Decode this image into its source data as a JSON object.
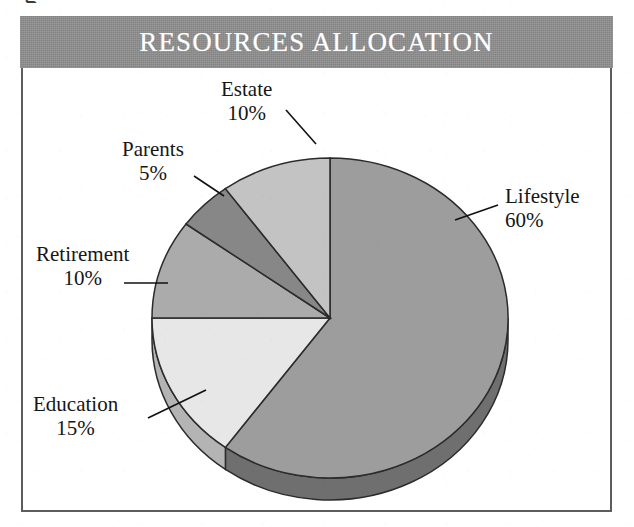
{
  "document": {
    "cut_glyph": "g"
  },
  "header": {
    "title": "RESOURCES ALLOCATION",
    "band_color": "#8e8e8e",
    "title_color": "#ffffff"
  },
  "frame": {
    "border_color": "#5d5d5d",
    "background": "#ffffff"
  },
  "chart_data": {
    "type": "pie",
    "title": "RESOURCES ALLOCATION",
    "xlabel": "",
    "ylabel": "",
    "legend_position": "none",
    "grid": false,
    "labels_show_percent": true,
    "three_d": true,
    "start_angle_deg": 0,
    "direction": "clockwise",
    "categories": [
      "Lifestyle",
      "Education",
      "Retirement",
      "Parents",
      "Estate"
    ],
    "values": [
      60,
      15,
      10,
      5,
      10
    ],
    "units": "%",
    "slices": [
      {
        "label": "Lifestyle",
        "value": 60,
        "percent_text": "60%",
        "color": "#9d9d9d",
        "side_color": "#6f6f6f"
      },
      {
        "label": "Education",
        "value": 15,
        "percent_text": "15%",
        "color": "#e7e7e7",
        "side_color": "#b4b4b4"
      },
      {
        "label": "Retirement",
        "value": 10,
        "percent_text": "10%",
        "color": "#ababab",
        "side_color": "#7c7c7c"
      },
      {
        "label": "Parents",
        "value": 5,
        "percent_text": "5%",
        "color": "#878787",
        "side_color": "#626262"
      },
      {
        "label": "Estate",
        "value": 10,
        "percent_text": "10%",
        "color": "#c3c3c3",
        "side_color": "#949494"
      }
    ]
  }
}
